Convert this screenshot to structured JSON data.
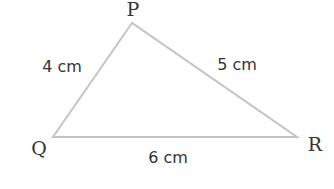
{
  "diagram": {
    "type": "triangle",
    "vertices": [
      {
        "name": "P",
        "x": 132,
        "y": 23,
        "label_x": 133,
        "label_y": 16
      },
      {
        "name": "Q",
        "x": 53,
        "y": 137,
        "label_x": 38,
        "label_y": 154
      },
      {
        "name": "R",
        "x": 297,
        "y": 137,
        "label_x": 315,
        "label_y": 150
      }
    ],
    "sides": [
      {
        "id": "PQ",
        "label": "4 cm",
        "x": 62,
        "y": 71
      },
      {
        "id": "PR",
        "label": "5 cm",
        "x": 237,
        "y": 69
      },
      {
        "id": "QR",
        "label": "6 cm",
        "x": 168,
        "y": 162
      }
    ],
    "colors": {
      "edge": "#c4c4c4",
      "text": "#333333",
      "background": "#ffffff"
    }
  }
}
